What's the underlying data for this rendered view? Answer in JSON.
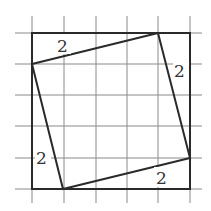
{
  "diagram": {
    "grid": {
      "cells": 5,
      "x_lines": [
        32,
        64,
        96,
        127,
        158,
        190
      ],
      "y_lines": [
        33,
        64,
        95,
        126,
        158,
        189
      ]
    },
    "labels": {
      "top": "2",
      "right": "2",
      "left": "2",
      "bottom": "2"
    },
    "colors": {
      "grid": "#8a8a8a",
      "lines": "#2a2a2a",
      "text": "#333333"
    }
  }
}
